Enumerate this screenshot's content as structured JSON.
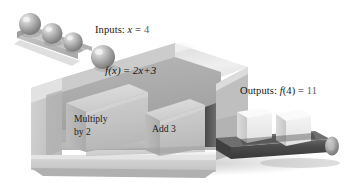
{
  "illustration": {
    "title": "Function machine diagram",
    "subject": "f(x) = 2x+3 function machine with input ramp and output conveyor"
  },
  "labels": {
    "inputs": {
      "prefix": "Inputs:",
      "variable": "x",
      "equals": "=",
      "value": "4"
    },
    "formula": {
      "fname": "f",
      "arg": "(x)",
      "equals": "=",
      "expression": "2x+3"
    },
    "outputs": {
      "prefix": "Outputs:",
      "fname": "f",
      "arg": "(4)",
      "equals": "=",
      "value": "11"
    }
  },
  "machine": {
    "blocks": [
      {
        "line1": "Multiply",
        "line2": "by 2"
      },
      {
        "line1": "Add 3",
        "line2": ""
      }
    ]
  },
  "input_ramp": {
    "sphere_count": 4,
    "spheres_on_ramp": 3,
    "sphere_on_box": 1
  },
  "output_conveyor": {
    "cube_count": 2
  },
  "colors": {
    "background": "#ffffff",
    "box_top": "#e7e7e7",
    "box_front": "#c9c9c9",
    "box_interior": "#a8a8a8",
    "box_shadow": "#9a9a9a",
    "block_face": "#c2c2c2",
    "block_top": "#d6d6d6",
    "sphere_mid": "#9d9d9d",
    "sphere_highlight": "#e4e4e4",
    "ramp": "#c4c4c4",
    "conveyor_belt": "#4a4a4a",
    "cube_face": "#efefef",
    "cube_top": "#f7f7f7",
    "text": "#151515"
  }
}
